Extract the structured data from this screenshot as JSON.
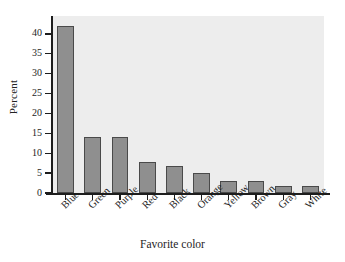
{
  "chart_data": {
    "type": "bar",
    "title": "",
    "subtitle": "",
    "xlabel": "Favorite color",
    "ylabel": "Percent",
    "categories": [
      "Blue",
      "Green",
      "Purple",
      "Red",
      "Black",
      "Orange",
      "Yellow",
      "Brown",
      "Gray",
      "White"
    ],
    "values": [
      42,
      14,
      14,
      7.8,
      6.9,
      5,
      3,
      2.9,
      1.8,
      1.8
    ],
    "ylim": [
      0,
      42
    ],
    "yticks": [
      0,
      5,
      10,
      15,
      20,
      25,
      30,
      35,
      40
    ],
    "ytick_labels": [
      "0",
      "5",
      "10",
      "15",
      "20",
      "25",
      "30",
      "35",
      "40"
    ],
    "grid": false,
    "legend": null,
    "legend_position": "none",
    "bar_fill_color": "#8f8f8f",
    "bar_edge_color": "#4a4a4a",
    "plot_background_color": "#ededed",
    "figure_background_color": "#ffffff",
    "axis_color": "#1d1d1d",
    "xlabel_rotation_degrees": -45
  }
}
